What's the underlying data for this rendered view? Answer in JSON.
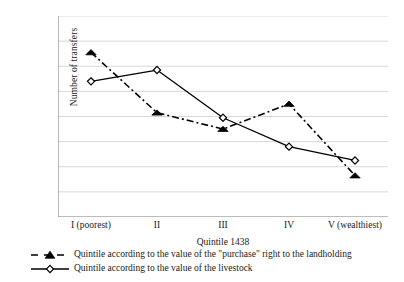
{
  "chart_data": {
    "type": "line",
    "title": "",
    "xlabel": "Quintile 1438",
    "ylabel": "Number of transfers",
    "categories": [
      "I (poorest)",
      "II",
      "III",
      "IV",
      "V (wealthiest)"
    ],
    "ylim": [
      1.0,
      2.6
    ],
    "ytick_labels": [
      "1.0",
      "1.2",
      "1.4",
      "1.6",
      "1.8",
      "2.0",
      "2.2",
      "2.4",
      "2.6"
    ],
    "ytick_values": [
      1.0,
      1.2,
      1.4,
      1.6,
      1.8,
      2.0,
      2.2,
      2.4,
      2.6
    ],
    "grid": true,
    "legend_position": "bottom",
    "series": [
      {
        "name": "Quintile according to the value of the \"purchase\" right to the landholding",
        "values": [
          2.31,
          1.83,
          1.7,
          1.9,
          1.33
        ],
        "marker": "filled-triangle",
        "linestyle": "dash-dot",
        "color": "#000000"
      },
      {
        "name": "Quintile according to the value of the livestock",
        "values": [
          2.08,
          2.17,
          1.79,
          1.56,
          1.45
        ],
        "marker": "open-diamond",
        "linestyle": "solid",
        "color": "#000000"
      }
    ]
  },
  "colors": {
    "axis": "#8c8c8c",
    "grid": "#d9d9d9",
    "ink": "#000000"
  }
}
